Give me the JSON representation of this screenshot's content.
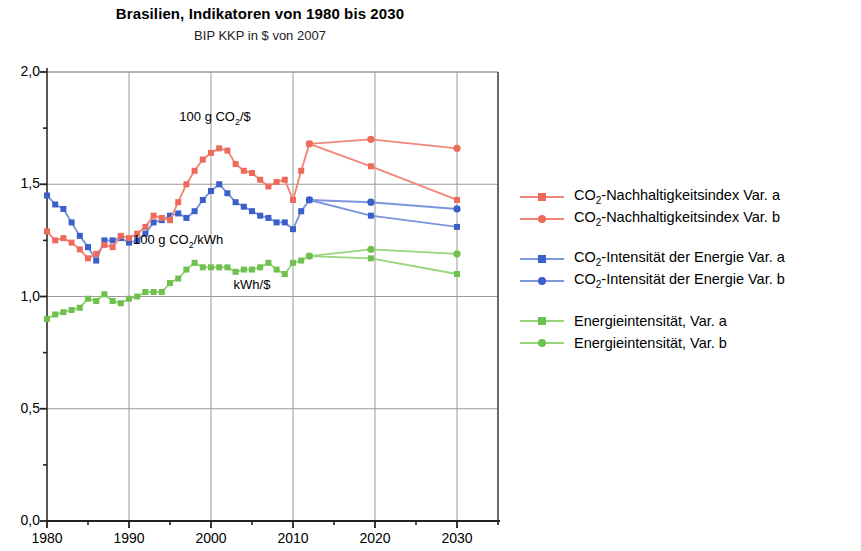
{
  "chart_data": {
    "type": "line",
    "title": "Brasilien, Indikatoren von 1980 bis 2030",
    "subtitle": "BIP KKP in $ von 2007",
    "xlabel": "",
    "ylabel": "",
    "xlim": [
      1980,
      2035
    ],
    "ylim": [
      0.0,
      2.0
    ],
    "grid": true,
    "legend_position": "right",
    "x_ticks": [
      "1980",
      "1990",
      "2000",
      "2010",
      "2020",
      "2030"
    ],
    "x_tick_values": [
      1980,
      1990,
      2000,
      2010,
      2020,
      2030
    ],
    "y_ticks": [
      "0,0",
      "0,5",
      "1,0",
      "1,5",
      "2,0"
    ],
    "y_tick_values": [
      0.0,
      0.5,
      1.0,
      1.5,
      2.0
    ],
    "y_minor_ticks": [
      0.25,
      0.75,
      1.25,
      1.75
    ],
    "x_minor_ticks": [
      1985,
      1995,
      2005,
      2015,
      2025,
      2035
    ],
    "colors": {
      "red_marker": "#EE6A5A",
      "red_line": "#F08878",
      "blue_marker": "#3A5FC8",
      "blue_line": "#7B96DD",
      "green_marker": "#6FC04F",
      "green_line": "#98D67C",
      "axis": "#555555",
      "grid": "#9a9a9a"
    },
    "annotations": [
      {
        "text": "100 g CO₂/$",
        "x": 2000.5,
        "y": 1.795,
        "name": "annotation-co2-per-dollar"
      },
      {
        "text": "100 g CO₂/kWh",
        "x": 1996.0,
        "y": 1.245,
        "name": "annotation-co2-per-kwh"
      },
      {
        "text": "kWh/$",
        "x": 2005.0,
        "y": 1.045,
        "name": "annotation-kwh-per-dollar"
      }
    ],
    "series": [
      {
        "name": "CO₂-Nachhaltigkeitsindex Var. a",
        "key": "co2_sustainability_var_a",
        "color": "#EE6A5A",
        "line_color": "#F08878",
        "marker": "square",
        "x": [
          1980,
          1981,
          1982,
          1983,
          1984,
          1985,
          1986,
          1987,
          1988,
          1989,
          1990,
          1991,
          1992,
          1993,
          1994,
          1995,
          1996,
          1997,
          1998,
          1999,
          2000,
          2001,
          2002,
          2003,
          2004,
          2005,
          2006,
          2007,
          2008,
          2009,
          2010,
          2011,
          2012,
          2019.5,
          2030
        ],
        "y": [
          1.29,
          1.25,
          1.26,
          1.24,
          1.21,
          1.17,
          1.19,
          1.23,
          1.22,
          1.27,
          1.26,
          1.28,
          1.31,
          1.36,
          1.35,
          1.34,
          1.42,
          1.5,
          1.56,
          1.61,
          1.64,
          1.66,
          1.65,
          1.59,
          1.56,
          1.55,
          1.52,
          1.49,
          1.51,
          1.52,
          1.43,
          1.56,
          1.68,
          1.58,
          1.43
        ]
      },
      {
        "name": "CO₂-Nachhaltigkeitsindex Var. b",
        "key": "co2_sustainability_var_b",
        "color": "#EE6A5A",
        "line_color": "#F08878",
        "marker": "circle",
        "x": [
          2012,
          2019.5,
          2030
        ],
        "y": [
          1.68,
          1.7,
          1.66
        ]
      },
      {
        "name": "CO₂-Intensität der Energie Var. a",
        "key": "co2_intensity_var_a",
        "color": "#3A5FC8",
        "line_color": "#7B96DD",
        "marker": "square",
        "x": [
          1980,
          1981,
          1982,
          1983,
          1984,
          1985,
          1986,
          1987,
          1988,
          1989,
          1990,
          1991,
          1992,
          1993,
          1994,
          1995,
          1996,
          1997,
          1998,
          1999,
          2000,
          2001,
          2002,
          2003,
          2004,
          2005,
          2006,
          2007,
          2008,
          2009,
          2010,
          2011,
          2012,
          2019.5,
          2030
        ],
        "y": [
          1.45,
          1.41,
          1.39,
          1.33,
          1.27,
          1.22,
          1.16,
          1.25,
          1.25,
          1.26,
          1.24,
          1.25,
          1.28,
          1.33,
          1.34,
          1.36,
          1.37,
          1.35,
          1.38,
          1.43,
          1.47,
          1.5,
          1.46,
          1.42,
          1.4,
          1.38,
          1.36,
          1.35,
          1.33,
          1.33,
          1.3,
          1.38,
          1.43,
          1.36,
          1.31
        ]
      },
      {
        "name": "CO₂-Intensität der Energie Var. b",
        "key": "co2_intensity_var_b",
        "color": "#3A5FC8",
        "line_color": "#7B96DD",
        "marker": "circle",
        "x": [
          2012,
          2019.5,
          2030
        ],
        "y": [
          1.43,
          1.42,
          1.39
        ]
      },
      {
        "name": "Energieintensität, Var. a",
        "key": "energy_intensity_var_a",
        "color": "#6FC04F",
        "line_color": "#98D67C",
        "marker": "square",
        "x": [
          1980,
          1981,
          1982,
          1983,
          1984,
          1985,
          1986,
          1987,
          1988,
          1989,
          1990,
          1991,
          1992,
          1993,
          1994,
          1995,
          1996,
          1997,
          1998,
          1999,
          2000,
          2001,
          2002,
          2003,
          2004,
          2005,
          2006,
          2007,
          2008,
          2009,
          2010,
          2011,
          2012,
          2019.5,
          2030
        ],
        "y": [
          0.9,
          0.92,
          0.93,
          0.94,
          0.95,
          0.99,
          0.98,
          1.01,
          0.98,
          0.97,
          0.99,
          1.0,
          1.02,
          1.02,
          1.02,
          1.06,
          1.08,
          1.12,
          1.15,
          1.13,
          1.13,
          1.13,
          1.13,
          1.11,
          1.12,
          1.12,
          1.13,
          1.15,
          1.12,
          1.1,
          1.15,
          1.16,
          1.18,
          1.17,
          1.1
        ]
      },
      {
        "name": "Energieintensität, Var. b",
        "key": "energy_intensity_var_b",
        "color": "#6FC04F",
        "line_color": "#98D67C",
        "marker": "circle",
        "x": [
          2012,
          2019.5,
          2030
        ],
        "y": [
          1.18,
          1.21,
          1.19
        ]
      }
    ]
  },
  "header": {
    "title": "Brasilien, Indikatoren von 1980 bis 2030",
    "subtitle": "BIP KKP in $ von 2007"
  },
  "legend": {
    "groups": [
      {
        "rows": [
          {
            "label": "CO₂-Nachhaltigkeitsindex Var. a",
            "color": "#EE6A5A",
            "line": "#F08878",
            "marker": "square"
          },
          {
            "label": "CO₂-Nachhaltigkeitsindex Var. b",
            "color": "#EE6A5A",
            "line": "#F08878",
            "marker": "circle"
          }
        ]
      },
      {
        "rows": [
          {
            "label": "CO₂-Intensität der Energie Var. a",
            "color": "#3A5FC8",
            "line": "#7B96DD",
            "marker": "square"
          },
          {
            "label": "CO₂-Intensität der Energie Var. b",
            "color": "#3A5FC8",
            "line": "#7B96DD",
            "marker": "circle"
          }
        ]
      },
      {
        "rows": [
          {
            "label": "Energieintensität, Var. a",
            "color": "#6FC04F",
            "line": "#98D67C",
            "marker": "square"
          },
          {
            "label": "Energieintensität, Var. b",
            "color": "#6FC04F",
            "line": "#98D67C",
            "marker": "circle"
          }
        ]
      }
    ]
  }
}
